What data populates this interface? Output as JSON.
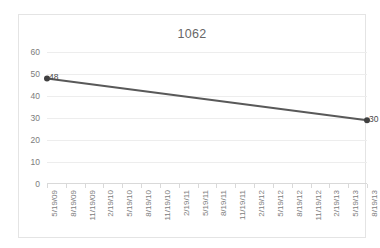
{
  "chart_data": {
    "type": "line",
    "title": "1062",
    "xlabel": "",
    "ylabel": "",
    "ylim": [
      0,
      60
    ],
    "ytick_values": [
      0,
      10,
      20,
      30,
      40,
      50,
      60
    ],
    "ytick_labels": [
      "0",
      "10",
      "20",
      "30",
      "40",
      "50",
      "60"
    ],
    "grid": true,
    "legend": false,
    "legend_position": "none",
    "categories": [
      "5/19/09",
      "8/19/09",
      "11/19/09",
      "2/19/10",
      "5/19/10",
      "8/19/10",
      "11/19/10",
      "2/19/11",
      "5/19/11",
      "8/19/11",
      "11/19/11",
      "2/19/12",
      "5/19/12",
      "8/19/12",
      "11/19/12",
      "2/19/13",
      "5/19/13",
      "8/19/13"
    ],
    "series": [
      {
        "name": "1062",
        "color": "#595959",
        "points": [
          {
            "category": "5/19/09",
            "category_index": 0,
            "value": 48,
            "label": "48"
          },
          {
            "category": "8/19/13",
            "category_index": 17,
            "value": 29,
            "label": "30"
          }
        ]
      }
    ]
  },
  "style": {
    "line_color": "#595959",
    "marker_color": "#404040",
    "gridline_color": "#ededed",
    "axis_color": "#d9d9d9",
    "title_color": "#676767",
    "tick_label_color": "#7c7c7c",
    "background": "#ffffff",
    "border_color": "#e4e4e4"
  }
}
